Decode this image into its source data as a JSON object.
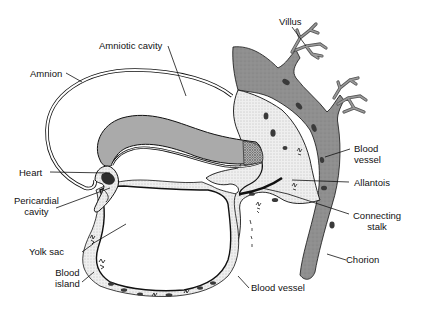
{
  "diagram": {
    "colors": {
      "chorion_fill": "#8f8f8f",
      "embryo_fill": "#a9a9a9",
      "mesoderm_fill": "#e6e6e6",
      "blood_dark": "#3a3a3a",
      "line": "#111111",
      "background": "#ffffff"
    },
    "labels": {
      "amniotic_cavity": "Amniotic cavity",
      "amnion": "Amnion",
      "villus": "Villus",
      "blood_vessel_top_1": "Blood",
      "blood_vessel_top_2": "vessel",
      "heart": "Heart",
      "pericardial_1": "Pericardial",
      "pericardial_2": "cavity",
      "allantois": "Allantois",
      "connecting_1": "Connecting",
      "connecting_2": "stalk",
      "yolk_sac": "Yolk sac",
      "blood_island_1": "Blood",
      "blood_island_2": "island",
      "chorion": "Chorion",
      "blood_vessel_bottom": "Blood vessel"
    }
  }
}
